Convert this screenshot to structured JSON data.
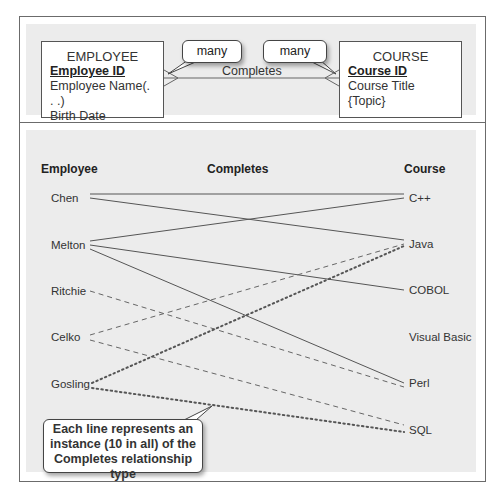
{
  "er_model": {
    "entity_left": {
      "name": "EMPLOYEE",
      "primary_key": "Employee ID",
      "attributes": [
        "Employee Name(. . .)",
        "Birth Date"
      ]
    },
    "entity_right": {
      "name": "COURSE",
      "primary_key": "Course ID",
      "attributes": [
        "Course Title",
        "{Topic}"
      ]
    },
    "relationship": {
      "name": "Completes",
      "cardinality_left": "many",
      "cardinality_right": "many"
    }
  },
  "instance_diagram": {
    "headers": {
      "employee": "Employee",
      "relationship": "Completes",
      "course": "Course"
    },
    "employees": [
      "Chen",
      "Melton",
      "Ritchie",
      "Celko",
      "Gosling"
    ],
    "courses": [
      "C++",
      "Java",
      "COBOL",
      "Visual Basic",
      "Perl",
      "SQL"
    ],
    "instances": [
      {
        "employee": "Chen",
        "course": "C++",
        "style": "solid"
      },
      {
        "employee": "Chen",
        "course": "Java",
        "style": "solid"
      },
      {
        "employee": "Melton",
        "course": "C++",
        "style": "solid"
      },
      {
        "employee": "Melton",
        "course": "COBOL",
        "style": "solid"
      },
      {
        "employee": "Melton",
        "course": "Perl",
        "style": "solid"
      },
      {
        "employee": "Ritchie",
        "course": "Perl",
        "style": "dashed"
      },
      {
        "employee": "Celko",
        "course": "Java",
        "style": "dashed"
      },
      {
        "employee": "Celko",
        "course": "SQL",
        "style": "dashed"
      },
      {
        "employee": "Gosling",
        "course": "Java",
        "style": "dotted"
      },
      {
        "employee": "Gosling",
        "course": "SQL",
        "style": "dotted"
      }
    ],
    "callout": "Each line represents an instance (10 in all) of the Completes relationship type"
  },
  "colors": {
    "panel_bg": "#ececec",
    "frame_border": "#6b6b6b",
    "line": "#555555"
  }
}
